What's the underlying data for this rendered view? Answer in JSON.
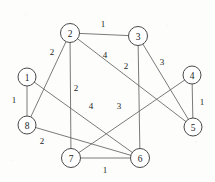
{
  "figure": {
    "type": "graph-diagram",
    "width": 215,
    "height": 182,
    "background_color": "#fdfdfc",
    "node_fill_color": "#ffffff",
    "node_stroke_color": "#4a4a4a",
    "edge_color": "#6b6b6b",
    "text_color": "#1c1c1c"
  },
  "chart_data": {
    "type": "diagram",
    "title": "",
    "nodes": [
      {
        "id": "1",
        "label": "1",
        "x": 27,
        "y": 77,
        "r": 9
      },
      {
        "id": "2",
        "label": "2",
        "x": 70,
        "y": 33,
        "r": 9.5
      },
      {
        "id": "3",
        "label": "3",
        "x": 138,
        "y": 36,
        "r": 9.5
      },
      {
        "id": "4",
        "label": "4",
        "x": 192,
        "y": 75,
        "r": 9
      },
      {
        "id": "5",
        "label": "5",
        "x": 193,
        "y": 127,
        "r": 9
      },
      {
        "id": "6",
        "label": "6",
        "x": 140,
        "y": 158,
        "r": 9.5
      },
      {
        "id": "7",
        "label": "7",
        "x": 71,
        "y": 158,
        "r": 9.5
      },
      {
        "id": "8",
        "label": "8",
        "x": 27,
        "y": 125,
        "r": 9
      }
    ],
    "edges": [
      {
        "source": "2",
        "target": "3",
        "weight": "1",
        "label_x": 103,
        "label_y": 24
      },
      {
        "source": "2",
        "target": "8",
        "weight": "2",
        "label_x": 52,
        "label_y": 52
      },
      {
        "source": "2",
        "target": "7",
        "weight": "2",
        "label_x": 76,
        "label_y": 88
      },
      {
        "source": "2",
        "target": "5",
        "weight": "4",
        "label_x": 105,
        "label_y": 55
      },
      {
        "source": "3",
        "target": "6",
        "weight": "2",
        "label_x": 126,
        "label_y": 66
      },
      {
        "source": "3",
        "target": "5",
        "weight": "3",
        "label_x": 162,
        "label_y": 62
      },
      {
        "source": "1",
        "target": "8",
        "weight": "1",
        "label_x": 14,
        "label_y": 100
      },
      {
        "source": "1",
        "target": "6",
        "weight": "4",
        "label_x": 91,
        "label_y": 106
      },
      {
        "source": "8",
        "target": "6",
        "weight": "2",
        "label_x": 42,
        "label_y": 141
      },
      {
        "source": "7",
        "target": "6",
        "weight": "1",
        "label_x": 105,
        "label_y": 170
      },
      {
        "source": "7",
        "target": "4",
        "weight": "3",
        "label_x": 119,
        "label_y": 106
      },
      {
        "source": "4",
        "target": "5",
        "weight": "1",
        "label_x": 202,
        "label_y": 102
      }
    ]
  }
}
